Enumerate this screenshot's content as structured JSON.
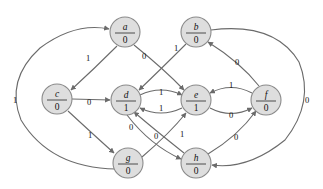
{
  "diagram": {
    "type": "directed-graph",
    "background_color": "#ffffff",
    "node_fill_color": "#dedede",
    "node_stroke_color": "#8a8a8a",
    "edge_color": "#6b6b6b",
    "label_color": "#111111"
  },
  "nodes": [
    {
      "id": "a",
      "letter": "a",
      "value": "0",
      "cx": 125,
      "cy": 32,
      "r": 15
    },
    {
      "id": "b",
      "letter": "b",
      "value": "0",
      "cx": 196,
      "cy": 32,
      "r": 15
    },
    {
      "id": "c",
      "letter": "c",
      "value": "0",
      "cx": 57,
      "cy": 99,
      "r": 15
    },
    {
      "id": "d",
      "letter": "d",
      "value": "1",
      "cx": 126,
      "cy": 100,
      "r": 15
    },
    {
      "id": "e",
      "letter": "e",
      "value": "1",
      "cx": 196,
      "cy": 100,
      "r": 15
    },
    {
      "id": "f",
      "letter": "f",
      "value": "0",
      "cx": 266,
      "cy": 100,
      "r": 15
    },
    {
      "id": "g",
      "letter": "g",
      "value": "0",
      "cx": 128,
      "cy": 163,
      "r": 15
    },
    {
      "id": "h",
      "letter": "h",
      "value": "0",
      "cx": 196,
      "cy": 163,
      "r": 15
    }
  ],
  "edges": [
    {
      "id": "a-c",
      "from": "a",
      "to": "c",
      "label": "1",
      "lx": 88,
      "ly": 58
    },
    {
      "id": "a-e",
      "from": "a",
      "to": "e",
      "label": "0",
      "lx": 144,
      "ly": 56
    },
    {
      "id": "b-d",
      "from": "b",
      "to": "d",
      "label": "1",
      "lx": 176,
      "ly": 48
    },
    {
      "id": "c-d",
      "from": "c",
      "to": "d",
      "label": "0",
      "lx": 89,
      "ly": 102
    },
    {
      "id": "c-g",
      "from": "c",
      "to": "g",
      "label": "1",
      "lx": 90,
      "ly": 135
    },
    {
      "id": "d-e",
      "from": "d",
      "to": "e",
      "label": "1",
      "lx": 161,
      "ly": 92
    },
    {
      "id": "e-d",
      "from": "e",
      "to": "d",
      "label": "1",
      "lx": 161,
      "ly": 108
    },
    {
      "id": "d-h",
      "from": "d",
      "to": "h",
      "label": "0",
      "lx": 131,
      "ly": 127
    },
    {
      "id": "h-d",
      "from": "h",
      "to": "d",
      "label": "0",
      "lx": 156,
      "ly": 136
    },
    {
      "id": "g-e",
      "from": "g",
      "to": "e",
      "label": "1",
      "lx": 182,
      "ly": 134
    },
    {
      "id": "h-f",
      "from": "h",
      "to": "f",
      "label": "0",
      "lx": 236,
      "ly": 137
    },
    {
      "id": "e-f",
      "from": "e",
      "to": "f",
      "label": "0",
      "lx": 231,
      "ly": 115
    },
    {
      "id": "f-e",
      "from": "f",
      "to": "e",
      "label": "1",
      "lx": 231,
      "ly": 85
    },
    {
      "id": "f-b",
      "from": "f",
      "to": "b",
      "label": "0",
      "lx": 237,
      "ly": 62
    },
    {
      "id": "g-a",
      "from": "g",
      "to": "a",
      "label": "1",
      "lx": 15,
      "ly": 100
    },
    {
      "id": "b-h",
      "from": "b",
      "to": "h",
      "label": "0",
      "lx": 307,
      "ly": 100
    }
  ]
}
